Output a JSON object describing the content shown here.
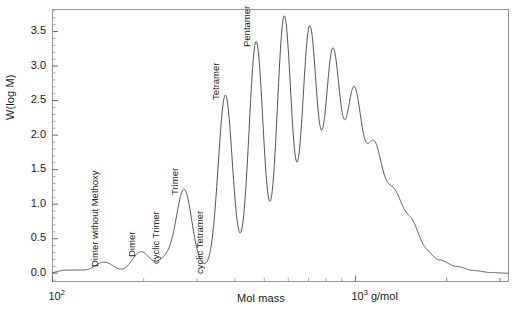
{
  "chart_data": {
    "type": "line",
    "title": "",
    "xlabel": "Mol mass",
    "ylabel": "W(log M)",
    "xscale": "log",
    "xlim": [
      100,
      3200
    ],
    "ylim": [
      -0.12,
      3.82
    ],
    "yticks": [
      0.0,
      0.5,
      1.0,
      1.5,
      2.0,
      2.5,
      3.0,
      3.5
    ],
    "ytick_labels": [
      "0.0",
      "0.5",
      "1.0",
      "1.5",
      "2.0",
      "2.5",
      "3.0",
      "3.5"
    ],
    "xticks": [
      100,
      1000
    ],
    "xtick_labels": [
      "10^2",
      "10^3 g/mol"
    ],
    "xtick_label_left": "10",
    "xtick_exp_left": "2",
    "xtick_label_right": "10",
    "xtick_exp_right": "3",
    "xtick_unit_right": " g/mol",
    "grid": false,
    "legend": "none",
    "line_color": "#3c3c3c",
    "frame_color": "#8c8c8c",
    "annotations": [
      {
        "label": "Dimer without Methoxy",
        "x": 148,
        "y": 0.16
      },
      {
        "label": "Dimer",
        "x": 196,
        "y": 0.31
      },
      {
        "label": "cyclic Trimer",
        "x": 236,
        "y": 0.2
      },
      {
        "label": "Trimer",
        "x": 272,
        "y": 1.21
      },
      {
        "label": "cyclic Tetramer",
        "x": 330,
        "y": 0.06
      },
      {
        "label": "Tetramer",
        "x": 372,
        "y": 2.58
      },
      {
        "label": "Pentamer",
        "x": 470,
        "y": 3.35
      }
    ],
    "peaks": [
      {
        "name": "unresolved-1",
        "x": 108,
        "height": 0.035,
        "width": 0.028
      },
      {
        "name": "unresolved-2",
        "x": 122,
        "height": 0.03,
        "width": 0.026
      },
      {
        "name": "dimer-without-methoxy",
        "x": 148,
        "height": 0.16,
        "width": 0.033
      },
      {
        "name": "dimer",
        "x": 196,
        "height": 0.31,
        "width": 0.03
      },
      {
        "name": "cyclic-trimer",
        "x": 236,
        "height": 0.195,
        "width": 0.026
      },
      {
        "name": "trimer",
        "x": 272,
        "height": 1.205,
        "width": 0.026
      },
      {
        "name": "cyclic-tetramer",
        "x": 318,
        "height": 0.06,
        "width": 0.022
      },
      {
        "name": "tetramer",
        "x": 372,
        "height": 2.58,
        "width": 0.0235
      },
      {
        "name": "pentamer",
        "x": 470,
        "height": 3.355,
        "width": 0.0235
      },
      {
        "name": "hexamer",
        "x": 582,
        "height": 3.72,
        "width": 0.0235
      },
      {
        "name": "heptamer",
        "x": 706,
        "height": 3.56,
        "width": 0.024
      },
      {
        "name": "octamer",
        "x": 842,
        "height": 3.205,
        "width": 0.0245
      },
      {
        "name": "nonamer",
        "x": 990,
        "height": 2.62,
        "width": 0.025
      },
      {
        "name": "decamer",
        "x": 1152,
        "height": 1.82,
        "width": 0.0255
      },
      {
        "name": "undecamer",
        "x": 1328,
        "height": 1.15,
        "width": 0.0265
      },
      {
        "name": "dodecamer",
        "x": 1520,
        "height": 0.76,
        "width": 0.028
      }
    ],
    "baseline_envelope": [
      {
        "x": 100,
        "y": -0.02
      },
      {
        "x": 130,
        "y": -0.012
      },
      {
        "x": 170,
        "y": -0.008
      },
      {
        "x": 230,
        "y": -0.005
      },
      {
        "x": 300,
        "y": 0.0
      },
      {
        "x": 380,
        "y": 0.01
      },
      {
        "x": 470,
        "y": 0.03
      },
      {
        "x": 580,
        "y": 0.07
      },
      {
        "x": 700,
        "y": 0.19
      },
      {
        "x": 840,
        "y": 0.38
      },
      {
        "x": 990,
        "y": 0.56
      },
      {
        "x": 1150,
        "y": 0.64
      },
      {
        "x": 1330,
        "y": 0.56
      },
      {
        "x": 1520,
        "y": 0.43
      },
      {
        "x": 1700,
        "y": 0.3
      },
      {
        "x": 1900,
        "y": 0.19
      },
      {
        "x": 2150,
        "y": 0.1
      },
      {
        "x": 2450,
        "y": 0.04
      },
      {
        "x": 2800,
        "y": 0.01
      },
      {
        "x": 3200,
        "y": 0.0
      }
    ]
  },
  "figure": {
    "ylabel": "W(log M)",
    "xlabel": "Mol mass"
  }
}
